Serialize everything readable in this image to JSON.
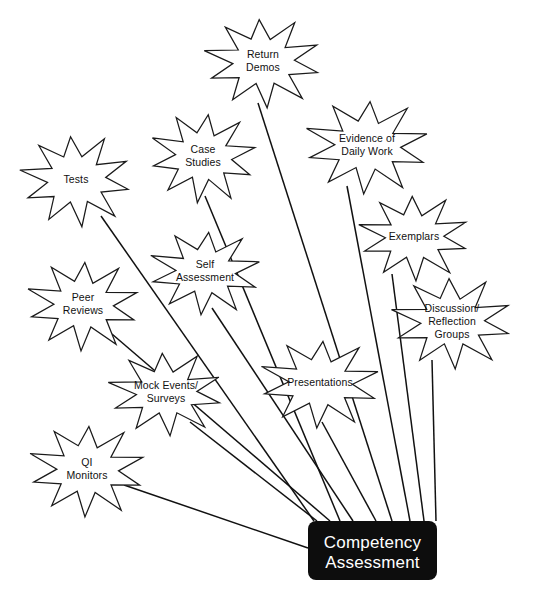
{
  "diagram": {
    "type": "radial-hub-and-spoke",
    "hub": {
      "title_line1": "Competency",
      "title_line2": "Assessment",
      "fill_color": "#0d0d0d",
      "text_color": "#ffffff",
      "x": 308,
      "y": 521,
      "width": 129,
      "height": 59,
      "corner_radius": 8
    },
    "node_style": {
      "shape": "10-point-star",
      "fill_color": "#ffffff",
      "stroke_color": "#1a1a1a"
    },
    "nodes": [
      {
        "id": "return-demos",
        "lines": [
          "Return",
          "Demos"
        ],
        "cx": 263,
        "cy": 62,
        "rx": 58,
        "ry": 45,
        "rot": -4,
        "anchor_x": 258,
        "anchor_y": 103,
        "target_x": 392,
        "target_y": 521
      },
      {
        "id": "evidence-of-daily-work",
        "lines": [
          "Evidence of",
          "Daily Work"
        ],
        "cx": 367,
        "cy": 146,
        "rx": 62,
        "ry": 47,
        "rot": 3,
        "anchor_x": 347,
        "anchor_y": 186,
        "target_x": 410,
        "target_y": 521
      },
      {
        "id": "case-studies",
        "lines": [
          "Case",
          "Studies"
        ],
        "cx": 203,
        "cy": 157,
        "rx": 53,
        "ry": 45,
        "rot": 6,
        "anchor_x": 205,
        "anchor_y": 196,
        "target_x": 340,
        "target_y": 521
      },
      {
        "id": "tests",
        "lines": [
          "Tests"
        ],
        "cx": 76,
        "cy": 180,
        "rx": 55,
        "ry": 46,
        "rot": -6,
        "anchor_x": 101,
        "anchor_y": 216,
        "target_x": 314,
        "target_y": 521
      },
      {
        "id": "exemplars",
        "lines": [
          "Exemplars"
        ],
        "cx": 414,
        "cy": 237,
        "rx": 55,
        "ry": 43,
        "rot": -2,
        "anchor_x": 392,
        "anchor_y": 274,
        "target_x": 424,
        "target_y": 521
      },
      {
        "id": "self-assessment",
        "lines": [
          "Self",
          "Assessment"
        ],
        "cx": 205,
        "cy": 272,
        "rx": 56,
        "ry": 42,
        "rot": 4,
        "anchor_x": 212,
        "anchor_y": 308,
        "target_x": 353,
        "target_y": 521
      },
      {
        "id": "peer-reviews",
        "lines": [
          "Peer",
          "Reviews"
        ],
        "cx": 83,
        "cy": 305,
        "rx": 56,
        "ry": 45,
        "rot": 2,
        "anchor_x": 112,
        "anchor_y": 334,
        "target_x": 330,
        "target_y": 521
      },
      {
        "id": "discussion-reflection-groups",
        "lines": [
          "Discussion/",
          "Reflection",
          "Groups"
        ],
        "cx": 452,
        "cy": 322,
        "rx": 60,
        "ry": 46,
        "rot": -3,
        "anchor_x": 432,
        "anchor_y": 360,
        "target_x": 436,
        "target_y": 521
      },
      {
        "id": "presentations",
        "lines": [
          "Presentations"
        ],
        "cx": 320,
        "cy": 383,
        "rx": 60,
        "ry": 44,
        "rot": 3,
        "anchor_x": 322,
        "anchor_y": 422,
        "target_x": 376,
        "target_y": 521
      },
      {
        "id": "mock-events-surveys",
        "lines": [
          "Mock Events/",
          "Surveys"
        ],
        "cx": 166,
        "cy": 393,
        "rx": 57,
        "ry": 42,
        "rot": -4,
        "anchor_x": 190,
        "anchor_y": 422,
        "target_x": 317,
        "target_y": 521
      },
      {
        "id": "qi-monitors",
        "lines": [
          "QI",
          "Monitors"
        ],
        "cx": 87,
        "cy": 470,
        "rx": 58,
        "ry": 46,
        "rot": 2,
        "anchor_x": 124,
        "anchor_y": 485,
        "target_x": 308,
        "target_y": 548
      }
    ]
  }
}
